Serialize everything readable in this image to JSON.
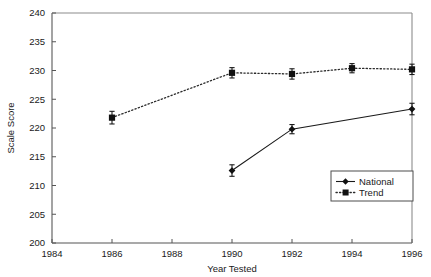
{
  "chart_data": {
    "type": "line",
    "title": "",
    "xlabel": "Year Tested",
    "ylabel": "Scale Score",
    "xlim": [
      1984,
      1996
    ],
    "ylim": [
      200,
      240
    ],
    "xticks": [
      1984,
      1986,
      1988,
      1990,
      1992,
      1994,
      1996
    ],
    "xtick_labels": [
      "1984",
      "1986",
      "1988",
      "1990",
      "1992",
      "1994",
      "1996"
    ],
    "yticks": [
      200,
      205,
      210,
      215,
      220,
      225,
      230,
      235,
      240
    ],
    "ytick_labels": [
      "200",
      "205",
      "210",
      "215",
      "220",
      "225",
      "230",
      "235",
      "240"
    ],
    "grid": false,
    "legend_position": "lower-right",
    "series": [
      {
        "name": "National",
        "marker": "diamond",
        "linestyle": "solid",
        "color": "#111111",
        "x": [
          1990,
          1992,
          1996
        ],
        "values": [
          212.6,
          219.8,
          223.3
        ],
        "errors": [
          1.0,
          0.8,
          1.0
        ]
      },
      {
        "name": "Trend",
        "marker": "square",
        "linestyle": "dotted",
        "color": "#111111",
        "x": [
          1986,
          1990,
          1992,
          1994,
          1996
        ],
        "values": [
          221.8,
          229.6,
          229.4,
          230.4,
          230.2
        ],
        "errors": [
          1.1,
          0.9,
          0.9,
          0.8,
          0.9
        ]
      }
    ]
  },
  "legend": {
    "entries": [
      {
        "label": "National"
      },
      {
        "label": "Trend"
      }
    ]
  },
  "axes": {
    "x_title": "Year Tested",
    "y_title": "Scale Score"
  }
}
